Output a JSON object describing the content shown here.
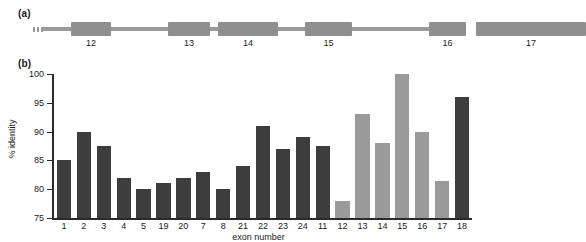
{
  "figure": {
    "panel_a_label": "(a)",
    "panel_b_label": "(b)"
  },
  "gene_diagram": {
    "exons": [
      {
        "label": "12",
        "start_pct": 9.5,
        "width_pct": 9.0
      },
      {
        "label": "13",
        "start_pct": 56.5,
        "width_pct": 9.5
      },
      {
        "label": "14",
        "start_pct": 74.5,
        "width_pct": 14.5
      },
      {
        "label": "15",
        "start_pct": 125.0,
        "width_pct": 11.5
      }
    ],
    "exons_all": [
      {
        "label": "12",
        "left": 38,
        "width": 40
      },
      {
        "label": "13",
        "left": 135,
        "width": 42
      },
      {
        "label": "14",
        "left": 185,
        "width": 60
      },
      {
        "label": "15",
        "left": 272,
        "width": 47
      },
      {
        "label": "16",
        "left": 396,
        "width": 37
      },
      {
        "label": "17",
        "left": 443,
        "width": 110
      }
    ],
    "dots_left": 3,
    "dots_right": 3
  },
  "chart_data": {
    "type": "bar",
    "title": "",
    "xlabel": "exon number",
    "ylabel": "% identity",
    "ylim": [
      75,
      100
    ],
    "yticks": [
      75,
      80,
      85,
      90,
      95,
      100
    ],
    "grid": false,
    "legend": null,
    "categories": [
      "1",
      "2",
      "3",
      "4",
      "5",
      "19",
      "20",
      "7",
      "8",
      "21",
      "22",
      "23",
      "24",
      "11",
      "12",
      "13",
      "14",
      "15",
      "16",
      "17",
      "18"
    ],
    "values": [
      85,
      90,
      87.5,
      82,
      80,
      81,
      82,
      83,
      80,
      84,
      91,
      87,
      89,
      87.5,
      78,
      93,
      88,
      100,
      90,
      81.5,
      96
    ],
    "bar_colors": [
      "dark",
      "dark",
      "dark",
      "dark",
      "dark",
      "dark",
      "dark",
      "dark",
      "dark",
      "dark",
      "dark",
      "dark",
      "dark",
      "dark",
      "light",
      "light",
      "light",
      "light",
      "light",
      "light",
      "dark"
    ],
    "series": [
      {
        "name": "% identity",
        "values": [
          85,
          90,
          87.5,
          82,
          80,
          81,
          82,
          83,
          80,
          84,
          91,
          87,
          89,
          87.5,
          78,
          93,
          88,
          100,
          90,
          81.5,
          96
        ]
      }
    ]
  },
  "colors": {
    "bar_dark": "#3d3d3d",
    "bar_light": "#9a9a9a",
    "axis": "#2a2a2a",
    "gene_gray": "#8f8f8f",
    "background": "#ffffff"
  }
}
